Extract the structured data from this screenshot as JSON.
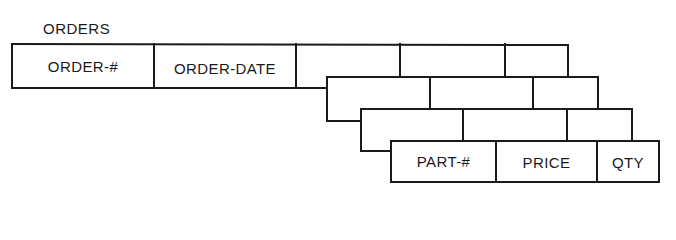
{
  "diagram": {
    "title": "ORDERS",
    "type": "repeating-group record layout",
    "stroke_color": "#1a1a1a",
    "rows": [
      {
        "name": "order-header",
        "fields": [
          {
            "label": "ORDER-#",
            "x": 12,
            "w": 142
          },
          {
            "label": "ORDER-DATE",
            "x": 154,
            "w": 142
          },
          {
            "label": "",
            "x": 296,
            "w": 104
          },
          {
            "label": "",
            "x": 400,
            "w": 105
          },
          {
            "label": "",
            "x": 505,
            "w": 63
          }
        ],
        "top": 44,
        "bottom": 88
      },
      {
        "name": "line-item-1",
        "fields": [
          {
            "label": "",
            "x": 327,
            "w": 103
          },
          {
            "label": "",
            "x": 430,
            "w": 103
          },
          {
            "label": "",
            "x": 533,
            "w": 65
          }
        ],
        "top": 77,
        "bottom": 121
      },
      {
        "name": "line-item-2",
        "fields": [
          {
            "label": "",
            "x": 361,
            "w": 102
          },
          {
            "label": "",
            "x": 463,
            "w": 104
          },
          {
            "label": "",
            "x": 567,
            "w": 65
          }
        ],
        "top": 109,
        "bottom": 151
      },
      {
        "name": "line-item-3",
        "fields": [
          {
            "label": "PART-#",
            "x": 391,
            "w": 105
          },
          {
            "label": "PRICE",
            "x": 496,
            "w": 101
          },
          {
            "label": "QTY",
            "x": 597,
            "w": 62
          }
        ],
        "top": 141,
        "bottom": 182
      }
    ]
  }
}
